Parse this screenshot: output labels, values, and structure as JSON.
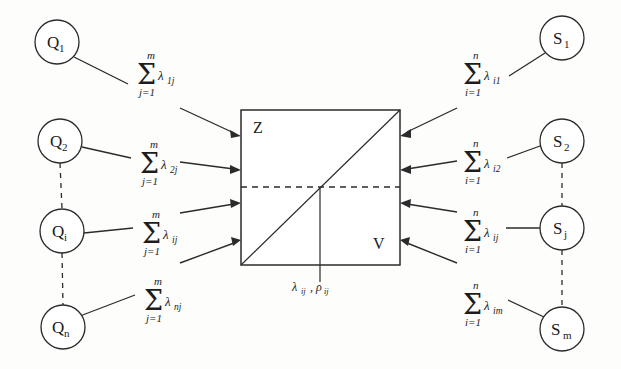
{
  "figure": {
    "background_color": "#fdfdfc",
    "stroke_color": "#2b2b2b"
  },
  "left_nodes": [
    {
      "base": "Q",
      "sub": "1",
      "cx": 57,
      "cy": 42,
      "r": 22
    },
    {
      "base": "Q",
      "sub": "2",
      "cx": 60,
      "cy": 141,
      "r": 22
    },
    {
      "base": "Q",
      "sub": "i",
      "cx": 62,
      "cy": 231,
      "r": 22
    },
    {
      "base": "Q",
      "sub": "n",
      "cx": 63,
      "cy": 327,
      "r": 22
    }
  ],
  "right_nodes": [
    {
      "base": "S",
      "sub": "1",
      "cx": 562,
      "cy": 38,
      "r": 22
    },
    {
      "base": "S",
      "sub": "2",
      "cx": 562,
      "cy": 141,
      "r": 22
    },
    {
      "base": "S",
      "sub": "j",
      "cx": 562,
      "cy": 228,
      "r": 22
    },
    {
      "base": "S",
      "sub": "m",
      "cx": 562,
      "cy": 329,
      "r": 22
    }
  ],
  "left_sums": [
    {
      "sigma": "Σ",
      "upper": "m",
      "lower": "j=1",
      "term": "λ",
      "term_sub": "1j",
      "x": 137,
      "y": 75
    },
    {
      "sigma": "Σ",
      "upper": "m",
      "lower": "j=1",
      "term": "λ",
      "term_sub": "2j",
      "x": 140,
      "y": 164
    },
    {
      "sigma": "Σ",
      "upper": "m",
      "lower": "j=1",
      "term": "λ",
      "term_sub": "ij",
      "x": 142,
      "y": 234
    },
    {
      "sigma": "Σ",
      "upper": "m",
      "lower": "j=1",
      "term": "λ",
      "term_sub": "nj",
      "x": 144,
      "y": 301
    }
  ],
  "right_sums": [
    {
      "sigma": "Σ",
      "upper": "n",
      "lower": "i=1",
      "term": "λ",
      "term_sub": "i1",
      "x": 463,
      "y": 75
    },
    {
      "sigma": "Σ",
      "upper": "n",
      "lower": "i=1",
      "term": "λ",
      "term_sub": "i2",
      "x": 463,
      "y": 163
    },
    {
      "sigma": "Σ",
      "upper": "n",
      "lower": "i=1",
      "term": "λ",
      "term_sub": "ij",
      "x": 463,
      "y": 232
    },
    {
      "sigma": "Σ",
      "upper": "n",
      "lower": "i=1",
      "term": "λ",
      "term_sub": "im",
      "x": 463,
      "y": 305
    }
  ],
  "center_box": {
    "x": 241,
    "y": 110,
    "width": 159,
    "height": 155,
    "top_label": "Z",
    "bottom_label": "V",
    "caption_lambda": "λ",
    "caption_lambda_sub": "ij",
    "caption_comma": ",",
    "caption_rho": "ρ",
    "caption_rho_sub": "ij"
  },
  "left_arrow_targets": [
    135,
    170,
    203,
    240
  ],
  "right_arrow_targets": [
    135,
    170,
    203,
    240
  ]
}
